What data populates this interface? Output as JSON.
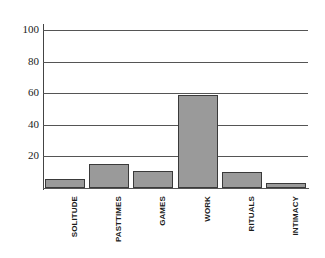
{
  "chart_data": {
    "type": "bar",
    "title": "",
    "subtitle": "",
    "xlabel": "",
    "ylabel": "",
    "categories": [
      "SOLITUDE",
      "PASTTIMES",
      "GAMES",
      "WORK",
      "RITUALS",
      "INTIMACY"
    ],
    "values": [
      6,
      15,
      11,
      59,
      10,
      3
    ],
    "series": [
      {
        "name": "",
        "values": [
          6,
          15,
          11,
          59,
          10,
          3
        ]
      }
    ],
    "ylim": [
      0,
      100
    ],
    "yticks": [
      20,
      40,
      60,
      80,
      100
    ],
    "ytick_labels": [
      "20",
      "40",
      "60",
      "80",
      "100"
    ],
    "grid": "horizontal",
    "legend": "none",
    "bar_color": "#9a9a9a",
    "bar_edge_color": "#3a3a3a",
    "grid_color": "#555555",
    "axis_color": "#444444",
    "background_color": "#ffffff",
    "text_color": "#1a1a1a"
  }
}
